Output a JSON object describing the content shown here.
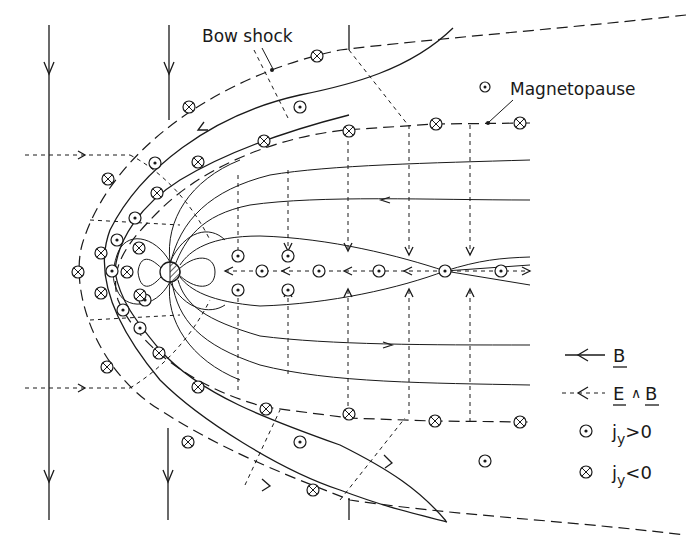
{
  "figure": {
    "labels": {
      "bow_shock": "Bow shock",
      "magnetopause": "Magnetopause"
    },
    "legend": {
      "items": [
        {
          "symbol": "solid-arrow",
          "text": "B",
          "meaning": "magnetic field line"
        },
        {
          "symbol": "dashed-arrow",
          "text": "E∧B",
          "meaning": "E cross B drift"
        },
        {
          "symbol": "circle-dot",
          "text": "jy>0",
          "meaning": "current out of page"
        },
        {
          "symbol": "circle-cross",
          "text": "jy<0",
          "meaning": "current into page"
        }
      ],
      "b_text": "B",
      "exb_text_e": "E",
      "exb_text_wedge": "∧",
      "exb_text_b": "B",
      "jy_pos_main": "j",
      "jy_pos_sub": "y",
      "jy_pos_rel": ">0",
      "jy_neg_main": "j",
      "jy_neg_sub": "y",
      "jy_neg_rel": "<0"
    },
    "current_symbols": {
      "positive_dot": [
        [
          300,
          107
        ],
        [
          155,
          163
        ],
        [
          113,
          271
        ],
        [
          123,
          312
        ],
        [
          138,
          232
        ],
        [
          238,
          256
        ],
        [
          288,
          256
        ],
        [
          238,
          290
        ],
        [
          288,
          290
        ],
        [
          232,
          271
        ],
        [
          262,
          271
        ],
        [
          307,
          271
        ],
        [
          378,
          271
        ],
        [
          445,
          271
        ],
        [
          501,
          271
        ],
        [
          300,
          442
        ],
        [
          483,
          461
        ],
        [
          145,
          324
        ],
        [
          128,
          240
        ]
      ],
      "negative_cross": [
        [
          317,
          56
        ],
        [
          189,
          107
        ],
        [
          349,
          103
        ],
        [
          435,
          124
        ],
        [
          521,
          124
        ],
        [
          263,
          142
        ],
        [
          198,
          162
        ],
        [
          157,
          192
        ],
        [
          139,
          219
        ],
        [
          108,
          245
        ],
        [
          78,
          271
        ],
        [
          102,
          293
        ],
        [
          127,
          301
        ],
        [
          160,
          355
        ],
        [
          197,
          387
        ],
        [
          266,
          408
        ],
        [
          349,
          414
        ],
        [
          436,
          421
        ],
        [
          520,
          422
        ],
        [
          188,
          442
        ],
        [
          313,
          490
        ]
      ]
    }
  }
}
